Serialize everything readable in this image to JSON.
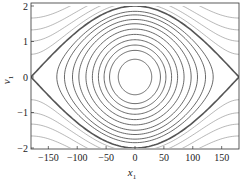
{
  "chart_data": {
    "type": "line",
    "title": "",
    "subtitle": "Phase portrait (pendulum): closed orbits, separatrix and rotating trajectories",
    "xlabel": "x1",
    "xlabel_main": "x",
    "xlabel_sub": "1",
    "ylabel": "v1",
    "ylabel_main": "v",
    "ylabel_sub": "1",
    "xlim": [
      -180,
      180
    ],
    "ylim": [
      -2,
      2
    ],
    "xticks": [
      -150,
      -100,
      -50,
      0,
      50,
      100,
      150
    ],
    "xtick_labels": [
      "−150",
      "−100",
      "−50",
      "0",
      "50",
      "100",
      "150"
    ],
    "yticks": [
      -2,
      -1,
      0,
      1,
      2
    ],
    "ytick_labels": [
      "−2",
      "−1",
      "0",
      "1",
      "2"
    ],
    "grid": false,
    "legend": "none",
    "separatrix": {
      "description": "v1 = ±2 cos(x1/2), x1 in degrees",
      "peak": 2.0,
      "saddles": [
        [
          -180,
          0
        ],
        [
          180,
          0
        ]
      ],
      "color": "#555555",
      "width": 1.6
    },
    "closed_orbit_amplitudes": [
      0.5,
      0.75,
      0.9,
      1.05,
      1.2,
      1.35,
      1.5,
      1.62,
      1.75,
      1.85
    ],
    "open_orbit_offsets": [
      0.05,
      0.12,
      0.2,
      0.3,
      0.42,
      0.55,
      0.7,
      0.88,
      1.08,
      1.3,
      1.55,
      1.85
    ],
    "colors": {
      "closed": "#444444",
      "open": "#888888",
      "separatrix": "#555555",
      "frame": "#333333"
    }
  }
}
